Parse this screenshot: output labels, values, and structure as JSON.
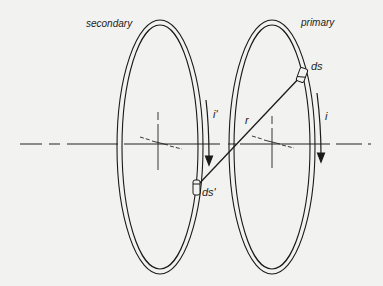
{
  "diagram": {
    "labels": {
      "secondary": "secondary",
      "primary": "primary",
      "ds": "ds",
      "ds_prime": "ds'",
      "r": "r",
      "i": "i",
      "i_prime": "i'"
    },
    "elements": [
      {
        "id": "secondary-loop",
        "type": "ellipse-ring",
        "center": [
          160,
          143
        ],
        "rx": 42,
        "ry": 121
      },
      {
        "id": "primary-loop",
        "type": "ellipse-ring",
        "center": [
          272,
          143
        ],
        "rx": 42,
        "ry": 121
      },
      {
        "id": "axis",
        "type": "dash-dot-line",
        "from": [
          20,
          143
        ],
        "to": [
          372,
          143
        ]
      },
      {
        "id": "r-vector",
        "type": "line",
        "from": [
          197,
          184
        ],
        "to": [
          301,
          75
        ]
      },
      {
        "id": "current-arrow-secondary",
        "direction": "down"
      },
      {
        "id": "current-arrow-primary",
        "direction": "down"
      }
    ],
    "colors": {
      "ink": "#1a1a1a",
      "background": "#f2f2f0"
    }
  }
}
